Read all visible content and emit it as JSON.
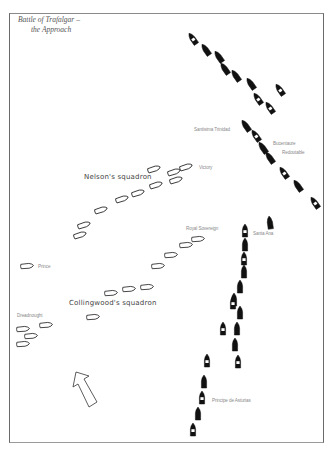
{
  "map": {
    "title_line1": "Battle of Trafalgar –",
    "title_line2": "the Approach",
    "colors": {
      "frame": "#6a6a6a",
      "ship_outline": "#222222",
      "ship_fill_enemy": "#111111",
      "ship_fill_british": "#ffffff",
      "label": "#8a8a8a"
    },
    "squadrons": {
      "nelson": "Nelson's squadron",
      "collingwood": "Collingwood's squadron"
    },
    "ship_labels": {
      "victory": "Victory",
      "royal_sovereign": "Royal Sovereign",
      "prince": "Prince",
      "dreadnought": "Dreadnought",
      "santisima_trinidad": "Santisima Trinidad",
      "bucentaure": "Bucentaure",
      "redoutable": "Redoutable",
      "santa_ana": "Santa Ana",
      "principe_de_asturias": "Principe de Asturias"
    },
    "wind_arrow": "wind-direction-arrow"
  }
}
